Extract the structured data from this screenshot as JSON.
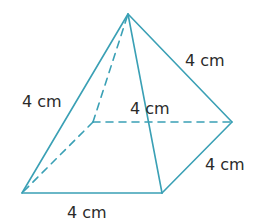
{
  "figure": {
    "type": "square-pyramid",
    "edge_color": "#3aa0b5",
    "label_color": "#2a2a2a",
    "labels": {
      "left_slant": "4 cm",
      "right_slant": "4 cm",
      "inner_slant": "4 cm",
      "base_right": "4 cm",
      "base_front": "4 cm"
    }
  }
}
